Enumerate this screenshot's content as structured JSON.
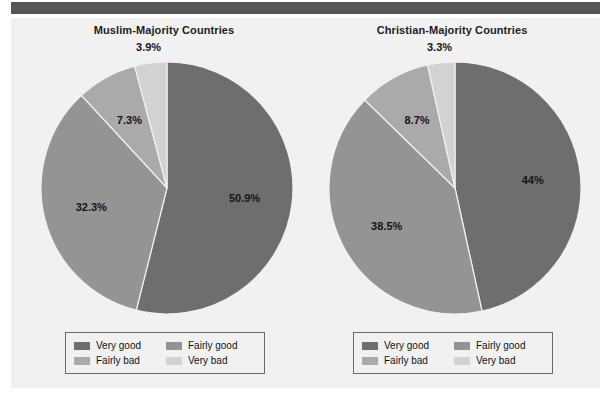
{
  "page": {
    "background_color": "#f1f1f1",
    "top_band_color": "#565656"
  },
  "palette": {
    "very_good": "#6e6e6e",
    "fairly_good": "#949494",
    "fairly_bad": "#aaaaaa",
    "very_bad": "#d2d2d2",
    "text": "#151515",
    "legend_border": "#6b6b6b"
  },
  "legend": {
    "items": [
      {
        "label": "Very good",
        "color": "#6e6e6e"
      },
      {
        "label": "Fairly good",
        "color": "#949494"
      },
      {
        "label": "Fairly bad",
        "color": "#aaaaaa"
      },
      {
        "label": "Very bad",
        "color": "#d2d2d2"
      }
    ]
  },
  "charts": [
    {
      "id": "muslim-majority",
      "title": "Muslim-Majority Countries",
      "labels": [
        "50.9%",
        "32.3%",
        "7.3%",
        "3.9%"
      ]
    },
    {
      "id": "christian-majority",
      "title": "Christian-Majority Countries",
      "labels": [
        "44%",
        "38.5%",
        "8.7%",
        "3.3%"
      ]
    }
  ],
  "chart_data": [
    {
      "type": "pie",
      "title": "Muslim-Majority Countries",
      "categories": [
        "Very good",
        "Fairly good",
        "Fairly bad",
        "Very bad"
      ],
      "values": [
        50.9,
        32.3,
        7.3,
        3.9
      ],
      "value_labels": [
        "50.9%",
        "32.3%",
        "7.3%",
        "3.9%"
      ],
      "colors": [
        "#6e6e6e",
        "#949494",
        "#aaaaaa",
        "#d2d2d2"
      ],
      "units": "percent",
      "start_angle_deg": 0,
      "direction": "clockwise",
      "legend_position": "bottom",
      "grid": false,
      "xlabel": "",
      "ylabel": ""
    },
    {
      "type": "pie",
      "title": "Christian-Majority Countries",
      "categories": [
        "Very good",
        "Fairly good",
        "Fairly bad",
        "Very bad"
      ],
      "values": [
        44.0,
        38.5,
        8.7,
        3.3
      ],
      "value_labels": [
        "44%",
        "38.5%",
        "8.7%",
        "3.3%"
      ],
      "colors": [
        "#6e6e6e",
        "#949494",
        "#aaaaaa",
        "#d2d2d2"
      ],
      "units": "percent",
      "start_angle_deg": 0,
      "direction": "clockwise",
      "legend_position": "bottom",
      "grid": false,
      "xlabel": "",
      "ylabel": ""
    }
  ]
}
